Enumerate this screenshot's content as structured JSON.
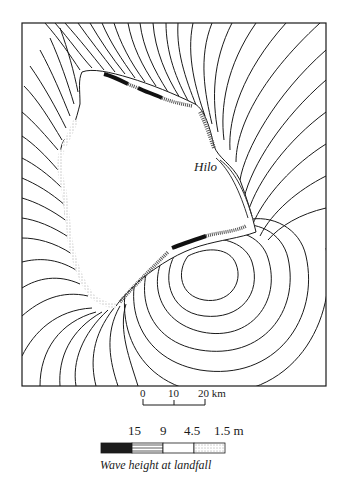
{
  "map": {
    "title": "Wave height at landfall",
    "places": [
      {
        "name": "Hilo",
        "x": 195,
        "y": 162
      }
    ],
    "frame": {
      "x": 22,
      "y": 23,
      "width": 304,
      "height": 363
    },
    "colors": {
      "line": "#1a1a1a",
      "background": "#ffffff",
      "land": "#ffffff"
    }
  },
  "scale_bar": {
    "ticks": [
      "0",
      "10",
      "20 km"
    ],
    "unit": "km"
  },
  "legend": {
    "values": [
      "15",
      "9",
      "4.5",
      "1.5 m"
    ],
    "caption": "Wave height at landfall",
    "swatches": [
      {
        "name": "15 m",
        "pattern": "solid-black"
      },
      {
        "name": "9 m",
        "pattern": "horizontal-hatch"
      },
      {
        "name": "4.5 m",
        "pattern": "vertical-hatch-open"
      },
      {
        "name": "1.5 m",
        "pattern": "stipple"
      }
    ]
  }
}
